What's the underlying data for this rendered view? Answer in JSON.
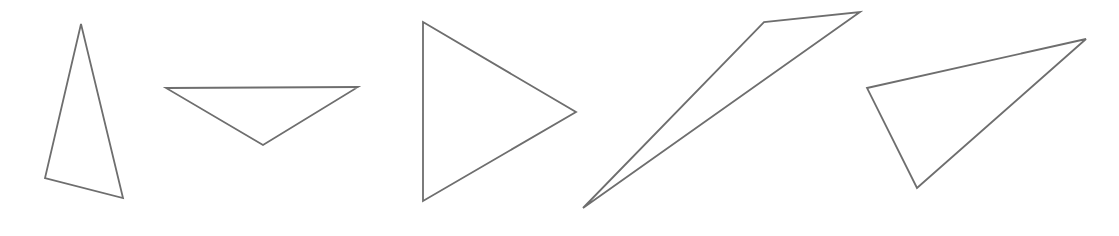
{
  "canvas": {
    "width": 1119,
    "height": 236,
    "background_color": "#ffffff",
    "stroke_color": "#6e6e6e",
    "stroke_width": 1.8,
    "fill": "none"
  },
  "figure": {
    "type": "shape-row",
    "shape_count": 5,
    "shape_kind": "triangle",
    "arrangement": "horizontal row, left to right"
  },
  "shapes": [
    {
      "index": 1,
      "name": "tall-narrow-triangle",
      "description": "tall narrow upward-pointing triangle, slightly tilted",
      "points": "81,24 45,178 123,198",
      "vertices": [
        [
          81,
          24
        ],
        [
          45,
          178
        ],
        [
          123,
          198
        ]
      ]
    },
    {
      "index": 2,
      "name": "wide-downward-triangle",
      "description": "wide flat downward-pointing triangle with horizontal top edge",
      "points": "166,88 358,87 263,145",
      "vertices": [
        [
          166,
          88
        ],
        [
          358,
          87
        ],
        [
          263,
          145
        ]
      ]
    },
    {
      "index": 3,
      "name": "right-pointing-triangle",
      "description": "right-pointing triangle with vertical left edge",
      "points": "423,22 576,112 423,201",
      "vertices": [
        [
          423,
          22
        ],
        [
          576,
          112
        ],
        [
          423,
          201
        ]
      ]
    },
    {
      "index": 4,
      "name": "thin-sliver-triangle",
      "description": "very thin elongated sliver triangle angled up to the right",
      "points": "583,208 764,22 860,12",
      "vertices": [
        [
          583,
          208
        ],
        [
          764,
          22
        ],
        [
          860,
          12
        ]
      ]
    },
    {
      "index": 5,
      "name": "obtuse-scalene-triangle",
      "description": "wide scalene triangle with long upper edge sloping up to the right",
      "points": "867,88 1086,39 917,188",
      "vertices": [
        [
          867,
          88
        ],
        [
          1086,
          39
        ],
        [
          917,
          188
        ]
      ]
    }
  ]
}
